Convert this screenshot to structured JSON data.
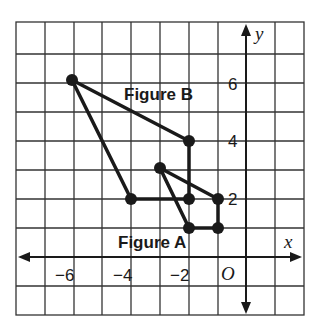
{
  "header_fragment": "g",
  "axes": {
    "x_label": "x",
    "y_label": "y",
    "origin_label": "O"
  },
  "x_ticks": [
    "−6",
    "−4",
    "−2"
  ],
  "y_ticks": [
    "6",
    "4",
    "2"
  ],
  "figures": [
    {
      "name": "Figure A",
      "vertices": [
        [
          -3,
          3
        ],
        [
          -1,
          2
        ],
        [
          -1,
          1
        ],
        [
          -2,
          1
        ]
      ]
    },
    {
      "name": "Figure B",
      "vertices": [
        [
          -6,
          6
        ],
        [
          -2,
          4
        ],
        [
          -2,
          2
        ],
        [
          -4,
          2
        ]
      ]
    }
  ],
  "grid": {
    "x_range": [
      -8,
      2
    ],
    "y_range": [
      -2,
      8
    ],
    "cell": 1
  },
  "colors": {
    "line": "#1a1a1a",
    "grid": "#333333",
    "background": "#ffffff"
  }
}
